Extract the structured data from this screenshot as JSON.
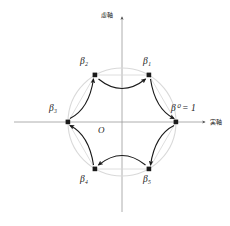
{
  "figure": {
    "name": "complex-plane-sixth-roots-of-unity-cycle",
    "background_color": "#ffffff",
    "axis_color": "#999999",
    "circle_color": "#d9d9d9",
    "chord_color": "#d0d0d0",
    "arrow_color": "#1a1a1a",
    "point_color": "#1a1a1a",
    "text_color": "#1a1a1a"
  },
  "axes": {
    "imaginary_label": "虚軸",
    "real_label": "実軸",
    "origin_label": "O"
  },
  "points": [
    {
      "id": "beta0",
      "label_main": "β",
      "label_sup": "0",
      "label_eq": " = 1",
      "angle_deg": 0,
      "cx": 176,
      "cy": 122
    },
    {
      "id": "beta1",
      "label_main": "β",
      "label_sub": "1",
      "angle_deg": 60,
      "cx": 149,
      "cy": 75
    },
    {
      "id": "beta2",
      "label_main": "β",
      "label_sub": "2",
      "angle_deg": 120,
      "cx": 95,
      "cy": 75
    },
    {
      "id": "beta3",
      "label_main": "β",
      "label_sub": "3",
      "angle_deg": 180,
      "cx": 68,
      "cy": 122
    },
    {
      "id": "beta4",
      "label_main": "β",
      "label_sub": "4",
      "angle_deg": 240,
      "cx": 95,
      "cy": 169
    },
    {
      "id": "beta5",
      "label_main": "β",
      "label_sub": "5",
      "angle_deg": 300,
      "cx": 149,
      "cy": 169
    }
  ],
  "labels": {
    "beta0": "β⁰ = 1",
    "beta1": "β₁",
    "beta2": "β₂",
    "beta3": "β₃",
    "beta4": "β₄",
    "beta5": "β₅"
  },
  "arrows": [
    {
      "id": "arrow-beta2-to-beta1",
      "from": "beta2",
      "to": "beta1"
    },
    {
      "id": "arrow-beta1-to-beta0",
      "from": "beta1",
      "to": "beta0"
    },
    {
      "id": "arrow-beta0-to-beta5",
      "from": "beta0",
      "to": "beta5"
    },
    {
      "id": "arrow-beta5-to-beta4",
      "from": "beta5",
      "to": "beta4"
    },
    {
      "id": "arrow-beta4-to-beta3",
      "from": "beta4",
      "to": "beta3"
    },
    {
      "id": "arrow-beta3-to-beta2",
      "from": "beta3",
      "to": "beta2"
    }
  ],
  "circle": {
    "center_x": 122,
    "center_y": 122,
    "radius": 54
  }
}
